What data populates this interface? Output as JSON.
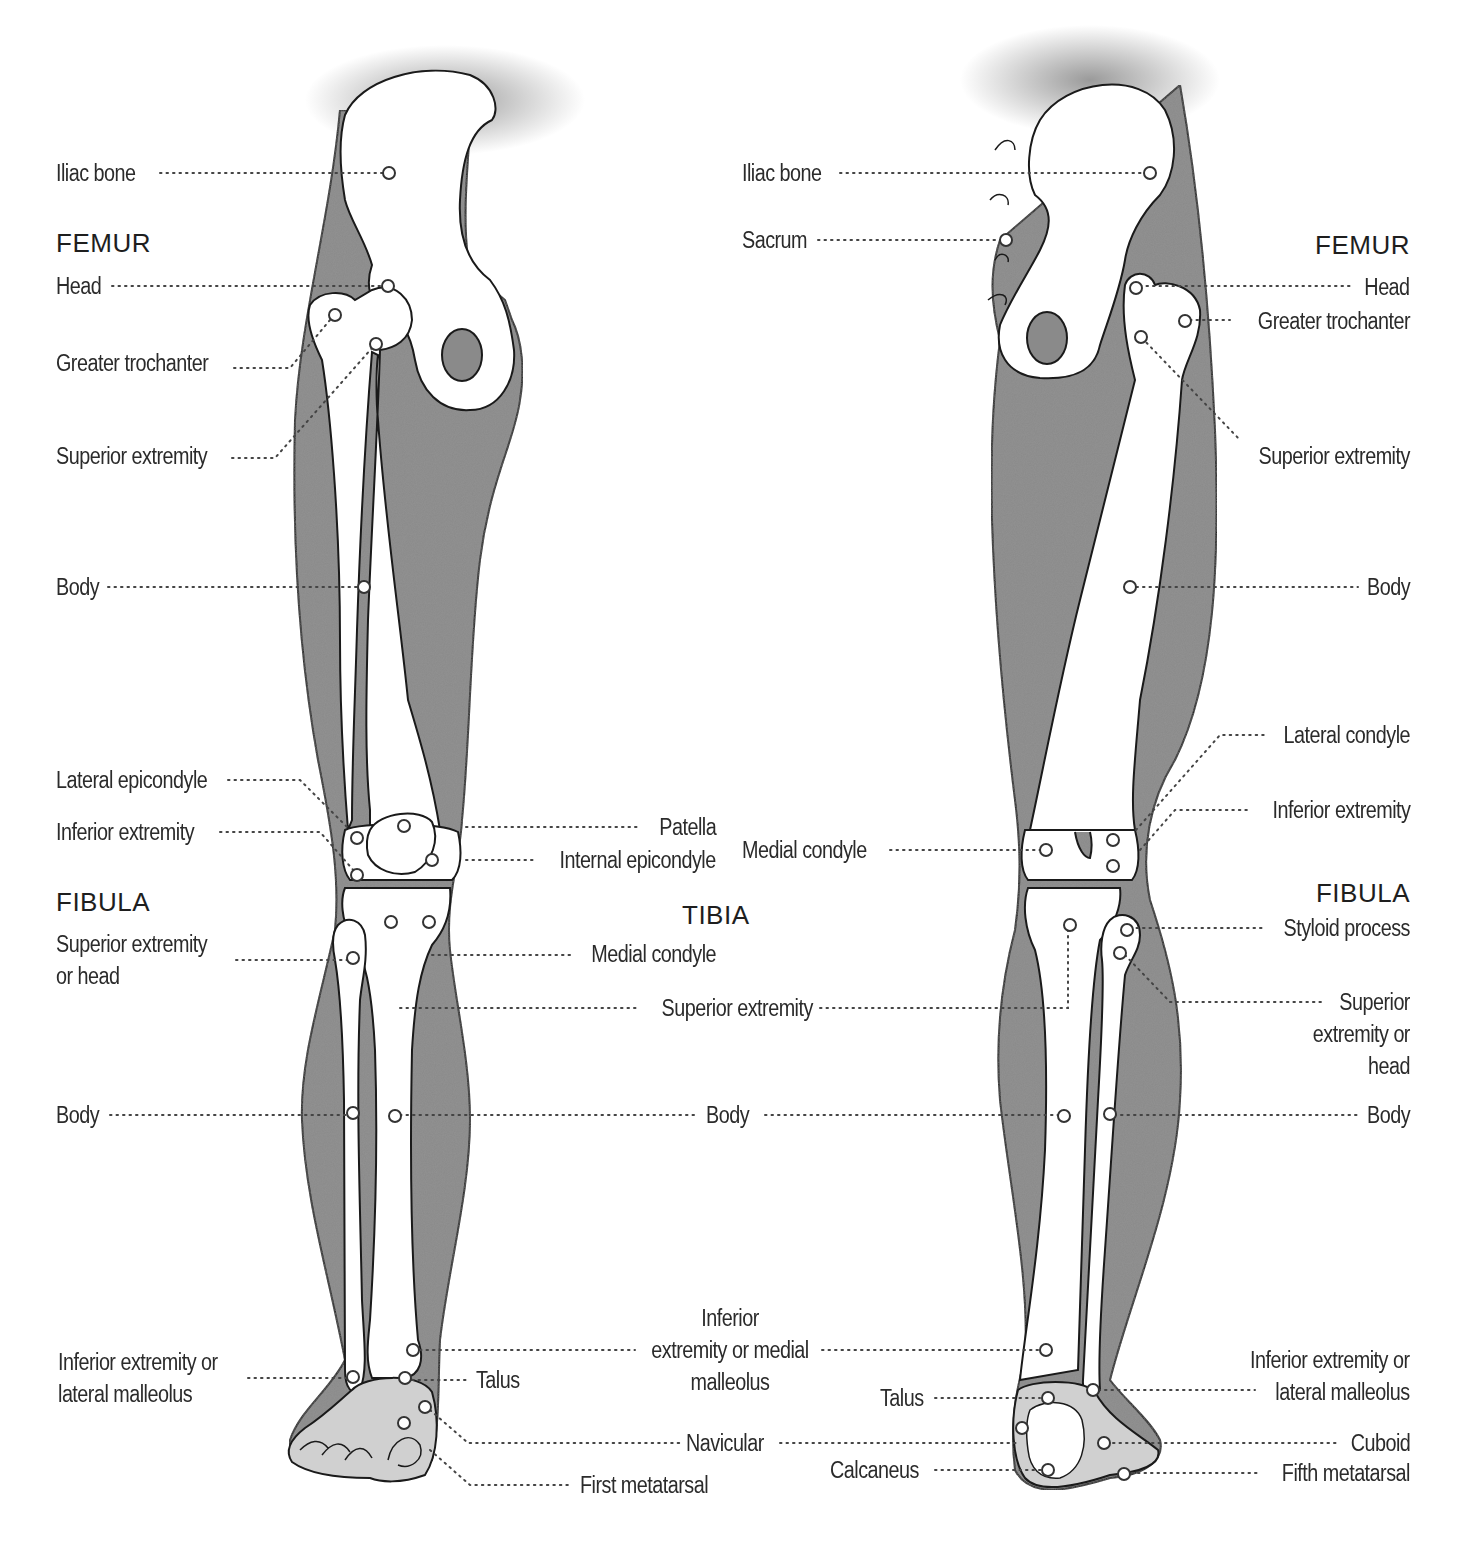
{
  "figure": {
    "type": "anatomical-diagram",
    "colors": {
      "soft_tissue": "#8a8a8a",
      "bone": "#ffffff",
      "outline": "#1a1a1a",
      "text": "#2b2b2b",
      "leader": "#444444"
    }
  },
  "anterior_view": {
    "headings": {
      "femur": "FEMUR",
      "fibula": "FIBULA",
      "tibia": "TIBIA"
    },
    "labels": {
      "iliac_bone": "Iliac bone",
      "femur_head": "Head",
      "greater_trochanter": "Greater trochanter",
      "femur_superior_extremity": "Superior extremity",
      "femur_body": "Body",
      "lateral_epicondyle": "Lateral epicondyle",
      "femur_inferior_extremity": "Inferior extremity",
      "patella": "Patella",
      "internal_epicondyle": "Internal epicondyle",
      "fibula_superior_extremity_1": "Superior extremity",
      "fibula_superior_extremity_2": "or head",
      "tibia_medial_condyle": "Medial condyle",
      "tibia_superior_extremity": "Superior extremity",
      "fibula_body": "Body",
      "tibia_body": "Body",
      "lateral_malleolus_1": "Inferior extremity or",
      "lateral_malleolus_2": "lateral malleolus",
      "medial_malleolus_1": "Inferior",
      "medial_malleolus_2": "extremity or medial",
      "medial_malleolus_3": "malleolus",
      "talus": "Talus",
      "navicular": "Navicular",
      "first_metatarsal": "First metatarsal"
    }
  },
  "posterior_view": {
    "headings": {
      "femur": "FEMUR",
      "fibula": "FIBULA"
    },
    "labels": {
      "iliac_bone": "Iliac bone",
      "sacrum": "Sacrum",
      "femur_head": "Head",
      "greater_trochanter": "Greater trochanter",
      "femur_superior_extremity": "Superior extremity",
      "femur_body": "Body",
      "lateral_condyle": "Lateral condyle",
      "femur_inferior_extremity": "Inferior extremity",
      "medial_condyle": "Medial condyle",
      "styloid_process": "Styloid process",
      "fibula_superior_extremity_1": "Superior",
      "fibula_superior_extremity_2": "extremity or",
      "fibula_superior_extremity_3": "head",
      "fibula_body": "Body",
      "lateral_malleolus_1": "Inferior extremity or",
      "lateral_malleolus_2": "lateral malleolus",
      "talus": "Talus",
      "cuboid": "Cuboid",
      "calcaneus": "Calcaneus",
      "fifth_metatarsal": "Fifth metatarsal"
    }
  }
}
